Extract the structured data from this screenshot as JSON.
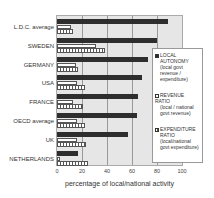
{
  "chart_data": {
    "type": "bar",
    "orientation": "horizontal",
    "title": "",
    "xlabel": "percentage of local/national activity",
    "ylabel": "",
    "xlim": [
      0,
      100
    ],
    "x_ticks": [
      "0",
      "20",
      "40",
      "60",
      "80",
      "100"
    ],
    "grid": true,
    "legend_position": "right",
    "categories": [
      "L.D.C. average",
      "SWEDEN",
      "GERMANY",
      "USA",
      "FRANCE",
      "OECD average",
      "UK",
      "NETHERLANDS"
    ],
    "series": [
      {
        "name": "LOCAL AUTONOMY (local govt revenue / expenditure)",
        "style": "solid-dark",
        "values": [
          89,
          80,
          73,
          68,
          65,
          64,
          57,
          17
        ]
      },
      {
        "name": "REVENUE RATIO (local / national govt revenue)",
        "style": "white",
        "values": [
          11,
          31,
          15,
          16,
          13,
          16,
          16,
          2
        ]
      },
      {
        "name": "EXPENDITURE RATIO (local/national govt expenditure)",
        "style": "hatched",
        "values": [
          13,
          38,
          17,
          22,
          21,
          22,
          23,
          25
        ]
      }
    ]
  },
  "legend": {
    "items": [
      {
        "title": "LOCAL",
        "sub": "AUTONOMY (local govt revenue / expenditure)"
      },
      {
        "title": "REVENUE RATIO",
        "sub": "(local / national govt revenue)"
      },
      {
        "title": "EXPENDITURE",
        "sub": "RATIO (local/national govt expenditure)"
      }
    ]
  }
}
